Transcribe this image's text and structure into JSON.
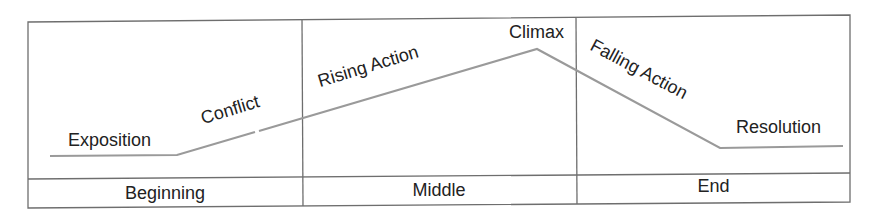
{
  "diagram": {
    "type": "plot-structure",
    "title": "",
    "colors": {
      "border": "#6e6e6e",
      "line": "#9a9a9a",
      "text": "#222222",
      "background": "#ffffff"
    },
    "stages": [
      {
        "label": "Exposition"
      },
      {
        "label": "Conflict"
      },
      {
        "label": "Rising Action"
      },
      {
        "label": "Climax"
      },
      {
        "label": "Falling Action"
      },
      {
        "label": "Resolution"
      }
    ],
    "sections": [
      {
        "label": "Beginning"
      },
      {
        "label": "Middle"
      },
      {
        "label": "End"
      }
    ],
    "line_points": [
      [
        50,
        156
      ],
      [
        177,
        155
      ],
      [
        537,
        49
      ],
      [
        720,
        148
      ],
      [
        843,
        146
      ]
    ]
  }
}
